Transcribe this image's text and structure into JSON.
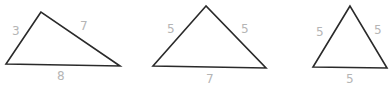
{
  "diagram": {
    "title": "",
    "stroke_color": "#2a2a2a",
    "label_color": "#b5b5b5",
    "triangles": [
      {
        "id": "scalene",
        "vertices": [
          [
            41,
            12
          ],
          [
            6,
            64
          ],
          [
            120,
            66
          ]
        ],
        "labels": [
          {
            "text": "3",
            "x": 12,
            "y": 25
          },
          {
            "text": "7",
            "x": 80,
            "y": 20
          },
          {
            "text": "8",
            "x": 57,
            "y": 70
          }
        ]
      },
      {
        "id": "isosceles",
        "vertices": [
          [
            206,
            6
          ],
          [
            153,
            66
          ],
          [
            266,
            68
          ]
        ],
        "labels": [
          {
            "text": "5",
            "x": 167,
            "y": 23
          },
          {
            "text": "5",
            "x": 241,
            "y": 23
          },
          {
            "text": "7",
            "x": 206,
            "y": 73
          }
        ]
      },
      {
        "id": "equilateral",
        "vertices": [
          [
            350,
            6
          ],
          [
            313,
            67
          ],
          [
            387,
            68
          ]
        ],
        "labels": [
          {
            "text": "5",
            "x": 316,
            "y": 26
          },
          {
            "text": "5",
            "x": 374,
            "y": 24
          },
          {
            "text": "5",
            "x": 346,
            "y": 73
          }
        ]
      }
    ]
  }
}
